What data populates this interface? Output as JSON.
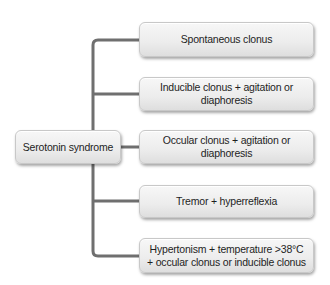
{
  "diagram": {
    "type": "tree",
    "root": {
      "label": "Serotonin syndrome"
    },
    "children": [
      {
        "label": "Spontaneous clonus"
      },
      {
        "label": "Inducible clonus + agitation or diaphoresis"
      },
      {
        "label": "Occular clonus + agitation or diaphoresis"
      },
      {
        "label": "Tremor + hyperreflexia"
      },
      {
        "label": "Hypertonism + temperature >38°C + occular clonus or inducible clonus"
      }
    ],
    "colors": {
      "connector": "#6f6f6f",
      "box_fill_top": "#f7f7f7",
      "box_fill_bottom": "#dedede",
      "text": "#1e1e1e"
    }
  }
}
